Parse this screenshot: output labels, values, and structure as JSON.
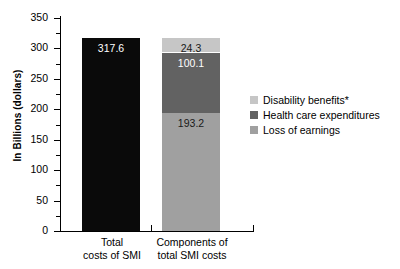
{
  "chart_data": {
    "type": "bar",
    "title": "",
    "xlabel": "",
    "ylabel": "In Billions (dollars)",
    "ylim": [
      0,
      350
    ],
    "ytick_step": 50,
    "yticks": [
      350,
      300,
      250,
      200,
      150,
      100,
      50,
      0
    ],
    "grid": false,
    "legend_position": "right",
    "categories": [
      "Total costs of SMI",
      "Components of total SMI costs"
    ],
    "bars": [
      {
        "category": "Total costs of SMI",
        "category_line1": "Total",
        "category_line2": "costs of SMI",
        "stacked": false,
        "value": 317.6,
        "value_label": "317.6",
        "color": "#0a0a0a",
        "label_color": "#ffffff"
      },
      {
        "category": "Components of total SMI costs",
        "category_line1": "Components of",
        "category_line2": "total SMI costs",
        "stacked": true,
        "total": 317.6,
        "segments": [
          {
            "name": "Disability benefits*",
            "value": 24.3,
            "value_label": "24.3",
            "color": "#c6c6c6",
            "label_color": "#1a1a1a"
          },
          {
            "name": "Health care expenditures",
            "value": 100.1,
            "value_label": "100.1",
            "color": "#626262",
            "label_color": "#ffffff"
          },
          {
            "name": "Loss of earnings",
            "value": 193.2,
            "value_label": "193.2",
            "color": "#a0a0a0",
            "label_color": "#1a1a1a"
          }
        ]
      }
    ],
    "legend": [
      {
        "label": "Disability benefits*",
        "color": "#c6c6c6"
      },
      {
        "label": "Health care expenditures",
        "color": "#626262"
      },
      {
        "label": "Loss of earnings",
        "color": "#a0a0a0"
      }
    ]
  }
}
